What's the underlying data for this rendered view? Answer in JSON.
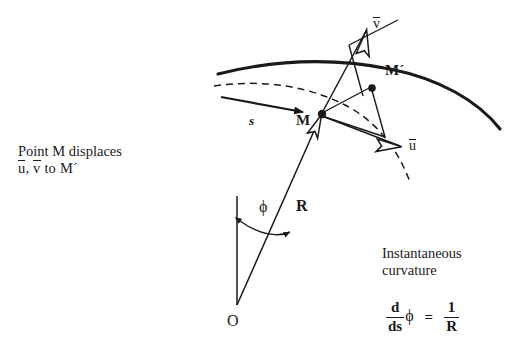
{
  "figure": {
    "title_not_shown": "",
    "background_color": "#ffffff",
    "ink_color": "#1a1a1a"
  },
  "caption": {
    "line1": "Point M displaces",
    "line2_vec_u": "u",
    "line2_comma": ",",
    "line2_vec_v": "v",
    "line2_tail": "to M´"
  },
  "labels": {
    "arc_length": "s",
    "point_m": "M",
    "point_m_prime": "M´",
    "vector_u": "u",
    "vector_v": "v",
    "angle_phi": "ϕ",
    "radius": "R",
    "origin": "O"
  },
  "note": {
    "line1": "Instantaneous",
    "line2": "curvature"
  },
  "equation": {
    "numerator": "d",
    "denominator": "ds",
    "phi": "ϕ",
    "equals": "=",
    "rhs_numerator": "1",
    "rhs_denominator": "R"
  },
  "geometry": {
    "solid_curve_desc": "deformed-beam-axis",
    "dashed_curve_desc": "original-beam-axis",
    "radius_line_desc": "radius-from-center-O",
    "vertical_line_desc": "reference-vertical-from-O"
  }
}
